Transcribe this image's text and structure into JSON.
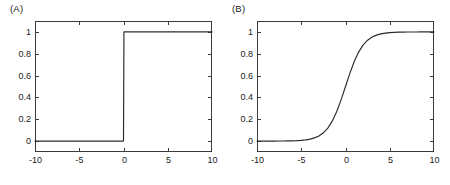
{
  "figure": {
    "background": "#ffffff",
    "line_color": "#2b2b2b",
    "axis_color": "#3a3a3a",
    "text_color": "#1a1a1a"
  },
  "panels": [
    {
      "label": "(A)",
      "name": "panel-a-heaviside-step"
    },
    {
      "label": "(B)",
      "name": "panel-b-logistic-sigmoid"
    }
  ],
  "chart_data": [
    {
      "type": "line",
      "title": "(A)",
      "xlabel": "",
      "ylabel": "",
      "xlim": [
        -10,
        10
      ],
      "ylim": [
        -0.1,
        1.1
      ],
      "grid": false,
      "legend": "none",
      "xticks": [
        -10,
        -5,
        0,
        5,
        10
      ],
      "xticklabels": [
        "-10",
        "-5",
        "0",
        "5",
        "10"
      ],
      "yticks": [
        0,
        0.2,
        0.4,
        0.6,
        0.8,
        1
      ],
      "yticklabels": [
        "0",
        "0.2",
        "0.4",
        "0.6",
        "0.8",
        "1"
      ],
      "series": [
        {
          "name": "Heaviside step function",
          "x": [
            -10,
            -9,
            -8,
            -7,
            -6,
            -5,
            -4,
            -3,
            -2,
            -1,
            -0.05,
            0,
            0.05,
            1,
            2,
            3,
            4,
            5,
            6,
            7,
            8,
            9,
            10
          ],
          "y": [
            0,
            0,
            0,
            0,
            0,
            0,
            0,
            0,
            0,
            0,
            0,
            0,
            1,
            1,
            1,
            1,
            1,
            1,
            1,
            1,
            1,
            1,
            1
          ]
        }
      ]
    },
    {
      "type": "line",
      "title": "(B)",
      "xlabel": "",
      "ylabel": "",
      "xlim": [
        -10,
        10
      ],
      "ylim": [
        -0.1,
        1.1
      ],
      "grid": false,
      "legend": "none",
      "xticks": [
        -10,
        -5,
        0,
        5,
        10
      ],
      "xticklabels": [
        "-10",
        "-5",
        "0",
        "5",
        "10"
      ],
      "yticks": [
        0,
        0.2,
        0.4,
        0.6,
        0.8,
        1
      ],
      "yticklabels": [
        "0",
        "0.2",
        "0.4",
        "0.6",
        "0.8",
        "1"
      ],
      "series": [
        {
          "name": "Logistic sigmoid 1/(1+exp(-x))",
          "x": [
            -10,
            -9.5,
            -9,
            -8.5,
            -8,
            -7.5,
            -7,
            -6.5,
            -6,
            -5.5,
            -5,
            -4.5,
            -4,
            -3.5,
            -3,
            -2.5,
            -2,
            -1.5,
            -1,
            -0.5,
            0,
            0.5,
            1,
            1.5,
            2,
            2.5,
            3,
            3.5,
            4,
            4.5,
            5,
            5.5,
            6,
            6.5,
            7,
            7.5,
            8,
            8.5,
            9,
            9.5,
            10
          ],
          "y": [
            4.54e-05,
            7.49e-05,
            0.0001234,
            0.0002035,
            0.0003354,
            0.0005527,
            0.0009111,
            0.0015012,
            0.0024726,
            0.0040701,
            0.0066929,
            0.0109869,
            0.0179862,
            0.0293122,
            0.0474259,
            0.0758582,
            0.1192029,
            0.1824255,
            0.2689414,
            0.3775407,
            0.5,
            0.6224593,
            0.7310586,
            0.8175745,
            0.8807971,
            0.9241418,
            0.9525741,
            0.9706878,
            0.9820138,
            0.9890131,
            0.9933071,
            0.9959299,
            0.9975274,
            0.9984988,
            0.9990889,
            0.9994473,
            0.9996646,
            0.9997965,
            0.9998766,
            0.9999251,
            0.9999546
          ]
        }
      ]
    }
  ]
}
